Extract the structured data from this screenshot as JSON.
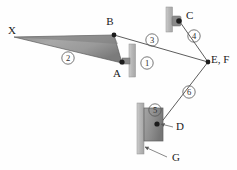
{
  "diagram": {
    "type": "kinematic-linkage-diagram",
    "background_color": "#fefefe",
    "width": 237,
    "height": 170,
    "point_labels": [
      {
        "id": "X",
        "text": "X",
        "x": 12,
        "y": 34
      },
      {
        "id": "B",
        "text": "B",
        "x": 110,
        "y": 25
      },
      {
        "id": "A",
        "text": "A",
        "x": 117,
        "y": 77
      },
      {
        "id": "C",
        "text": "C",
        "x": 186,
        "y": 19
      },
      {
        "id": "EF",
        "text": "E, F",
        "x": 211,
        "y": 63
      },
      {
        "id": "D",
        "text": "D",
        "x": 176,
        "y": 130
      },
      {
        "id": "G",
        "text": "G",
        "x": 172,
        "y": 161
      }
    ],
    "link_numbers": [
      {
        "id": "link-1",
        "text": "1",
        "cx": 147,
        "cy": 63
      },
      {
        "id": "link-2",
        "text": "2",
        "cx": 68,
        "cy": 58
      },
      {
        "id": "link-3",
        "text": "3",
        "cx": 152,
        "cy": 40
      },
      {
        "id": "link-4",
        "text": "4",
        "cx": 194,
        "cy": 36
      },
      {
        "id": "link-5",
        "text": "5",
        "cx": 155,
        "cy": 110
      },
      {
        "id": "link-6",
        "text": "6",
        "cx": 189,
        "cy": 92
      }
    ],
    "colors": {
      "wedge_fill_light": "#b9b9b9",
      "wedge_fill_dark": "#6e6e6e",
      "wall_bar": "#bdbdbd",
      "slider_block": "#9a9a9a",
      "slider_block_dark": "#7d7d7d",
      "line": "#4a4a4a",
      "label_text": "#1a1a1a"
    },
    "members": {
      "ternary_link_2": {
        "label": "2",
        "vertices": "X, B, A"
      },
      "link_3": {
        "label": "3",
        "from": "B",
        "to": "E, F"
      },
      "link_4": {
        "label": "4",
        "from": "C",
        "to": "E, F"
      },
      "link_6": {
        "label": "6",
        "from": "E, F",
        "to": "D"
      },
      "frame_1": {
        "label": "1",
        "note": "ground support at A"
      },
      "slider_5": {
        "label": "5",
        "note": "block at D"
      },
      "ground_G": {
        "label": "G",
        "note": "fixed guide surface"
      }
    }
  }
}
